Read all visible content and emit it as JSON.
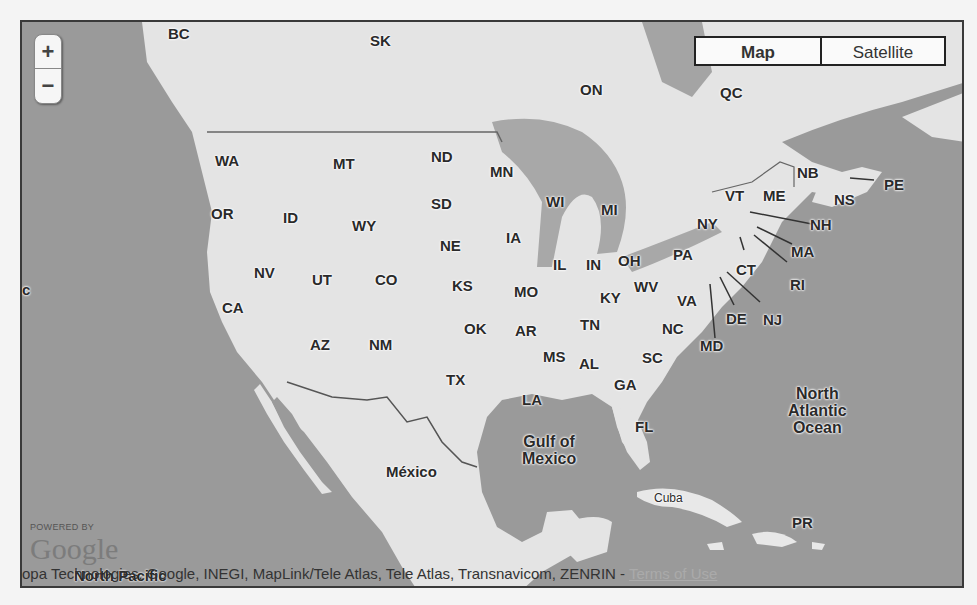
{
  "controls": {
    "zoom_in": "+",
    "zoom_out": "−",
    "map_type": {
      "map": "Map",
      "satellite": "Satellite",
      "selected": "Map"
    }
  },
  "labels": {
    "canada": [
      "BC",
      "SK",
      "ON",
      "QC",
      "NB",
      "NS",
      "PE"
    ],
    "states": [
      "WA",
      "OR",
      "CA",
      "NV",
      "ID",
      "MT",
      "WY",
      "UT",
      "AZ",
      "CO",
      "NM",
      "ND",
      "SD",
      "NE",
      "KS",
      "OK",
      "TX",
      "MN",
      "IA",
      "MO",
      "AR",
      "LA",
      "WI",
      "IL",
      "MI",
      "IN",
      "OH",
      "KY",
      "TN",
      "MS",
      "AL",
      "GA",
      "FL",
      "SC",
      "NC",
      "VA",
      "WV",
      "PA",
      "NY",
      "VT",
      "ME",
      "NH",
      "MA",
      "RI",
      "CT",
      "NJ",
      "DE",
      "MD"
    ],
    "other": {
      "mexico": "México",
      "gulf": "Gulf of Mexico",
      "gulf_l1": "Gulf of",
      "gulf_l2": "Mexico",
      "atlantic_l1": "North",
      "atlantic_l2": "Atlantic",
      "atlantic_l3": "Ocean",
      "cuba": "Cuba",
      "pr": "PR",
      "north_pacific": "North Pacific",
      "edge_c": "c",
      "guatemala": "Guatemala"
    }
  },
  "footer": {
    "powered_by": "POWERED BY",
    "logo": "Google",
    "attribution": "opa Technologies, Google, INEGI, MapLink/Tele Atlas, Tele Atlas, Transnavicom, ZENRIN - ",
    "terms": "Terms of Use"
  },
  "colors": {
    "water": "#9a9a9a",
    "land": "#e6e6e6",
    "border": "#555555"
  }
}
